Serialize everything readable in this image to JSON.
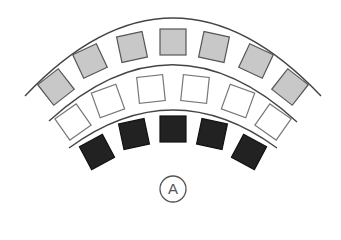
{
  "diagram": {
    "label": "A",
    "colors": {
      "arc": "#444444",
      "gray_fill": "#c8c8c8",
      "gray_stroke": "#555555",
      "white_fill": "#ffffff",
      "white_stroke": "#777777",
      "black_fill": "#222222",
      "black_stroke": "#111111",
      "label_circle": "#555555"
    },
    "arcs": [
      {
        "name": "outer-arc",
        "d": "M25,96 Q173,-60 321,96"
      },
      {
        "name": "middle-arc",
        "d": "M49,121 Q173,8 297,122"
      },
      {
        "name": "inner-arc",
        "d": "M69,148 Q173,72 277,148"
      }
    ],
    "rows": [
      {
        "name": "outer-row",
        "style": "gray",
        "size": 26,
        "squares": [
          {
            "cx": 56,
            "cy": 87,
            "rot": -38
          },
          {
            "cx": 90,
            "cy": 61,
            "rot": -25
          },
          {
            "cx": 132,
            "cy": 47,
            "rot": -12
          },
          {
            "cx": 173,
            "cy": 42,
            "rot": 0
          },
          {
            "cx": 214,
            "cy": 47,
            "rot": 12
          },
          {
            "cx": 256,
            "cy": 61,
            "rot": 25
          },
          {
            "cx": 290,
            "cy": 87,
            "rot": 38
          }
        ]
      },
      {
        "name": "middle-row",
        "style": "white",
        "size": 26,
        "squares": [
          {
            "cx": 73,
            "cy": 122,
            "rot": -35
          },
          {
            "cx": 108,
            "cy": 101,
            "rot": -20
          },
          {
            "cx": 151,
            "cy": 89,
            "rot": -6
          },
          {
            "cx": 195,
            "cy": 89,
            "rot": 6
          },
          {
            "cx": 238,
            "cy": 101,
            "rot": 20
          },
          {
            "cx": 273,
            "cy": 122,
            "rot": 35
          }
        ]
      },
      {
        "name": "inner-row",
        "style": "black",
        "size": 26,
        "squares": [
          {
            "cx": 97,
            "cy": 152,
            "rot": -28
          },
          {
            "cx": 134,
            "cy": 134,
            "rot": -12
          },
          {
            "cx": 173,
            "cy": 129,
            "rot": 0
          },
          {
            "cx": 212,
            "cy": 134,
            "rot": 12
          },
          {
            "cx": 249,
            "cy": 152,
            "rot": 28
          }
        ]
      }
    ],
    "label_circle": {
      "cx": 173,
      "cy": 189,
      "r": 13
    }
  }
}
